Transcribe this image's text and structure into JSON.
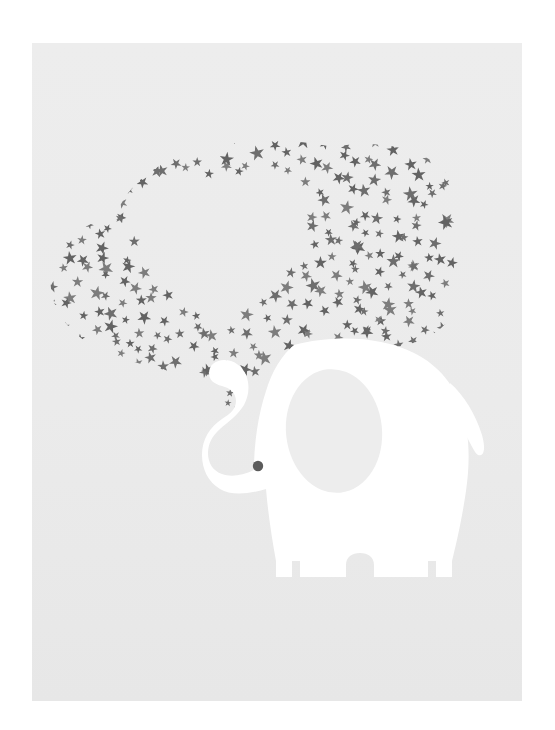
{
  "artwork": {
    "title": "Elephant Blowing a Heart of Stars",
    "medium": "Nursery art print / poster illustration",
    "subject_label": "elephant",
    "motif_label": "star cloud forming a heart",
    "style": "flat vector silhouette"
  },
  "canvas": {
    "width": 555,
    "height": 730,
    "page_background": "#ffffff",
    "poster": {
      "x": 32,
      "y": 43,
      "width": 490,
      "height": 658,
      "background": "#ebebeb"
    }
  },
  "colors": {
    "page_white": "#ffffff",
    "poster_background": "#ebebeb",
    "poster_background_top": "#ededed",
    "poster_background_bottom": "#e8e8e8",
    "elephant_body": "#ffffff",
    "elephant_ear": "#ededed",
    "elephant_eye": "#5b5b5b",
    "star_gray": "#6e6e6e",
    "star_gray_light": "#7d7d7d",
    "star_gray_dark": "#636363"
  },
  "elements": {
    "elephant": {
      "name": "elephant-silhouette",
      "fill": "#ffffff",
      "bounds": {
        "x": 150,
        "y": 292,
        "width": 300,
        "height": 250
      },
      "parts": [
        {
          "name": "body",
          "label": "Body"
        },
        {
          "name": "head",
          "label": "Head"
        },
        {
          "name": "trunk",
          "label": "Curled trunk"
        },
        {
          "name": "ear",
          "label": "Ear",
          "fill": "#ededed"
        },
        {
          "name": "eye",
          "label": "Eye",
          "fill": "#5b5b5b",
          "radius": 5
        },
        {
          "name": "tail",
          "label": "Tail"
        },
        {
          "name": "legs",
          "label": "Legs",
          "count": 4
        }
      ]
    },
    "star_cloud": {
      "name": "star-cloud",
      "star_count": 320,
      "star_color": "#6e6e6e",
      "star_points": 5,
      "star_size_min": 7,
      "star_size_max": 13,
      "negative_space": "heart",
      "bounds": {
        "x": 20,
        "y": 80,
        "width": 400,
        "height": 300
      }
    },
    "heart_void": {
      "name": "heart-negative-space",
      "label": "Heart-shaped gap in the star cloud",
      "center": {
        "x": 190,
        "y": 215
      },
      "width": 150,
      "height": 140
    }
  }
}
